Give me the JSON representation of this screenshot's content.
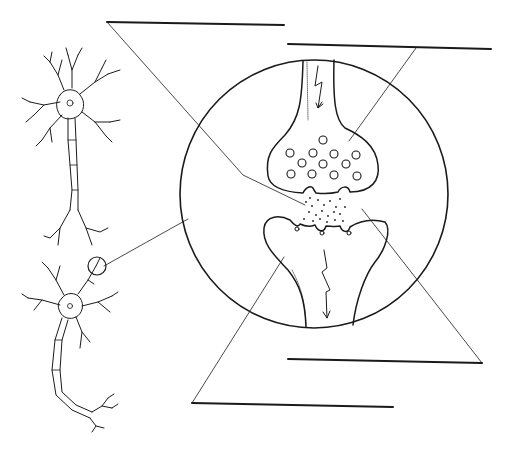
{
  "diagram": {
    "colors": {
      "ink": "#1a1a1a",
      "background": "#ffffff"
    },
    "labels": [
      {
        "id": "label-1",
        "text": "",
        "line": [
          107,
          22,
          284,
          25
        ],
        "points_to": "synaptic cleft"
      },
      {
        "id": "label-2",
        "text": "",
        "line": [
          288,
          44,
          491,
          49
        ],
        "points_to": "synaptic vesicles in axon terminal"
      },
      {
        "id": "label-3",
        "text": "",
        "line": [
          288,
          359,
          482,
          363
        ],
        "points_to": "receptor site"
      },
      {
        "id": "label-4",
        "text": "",
        "line": [
          192,
          403,
          393,
          407
        ],
        "points_to": "dendrite of receiving neuron"
      }
    ]
  }
}
